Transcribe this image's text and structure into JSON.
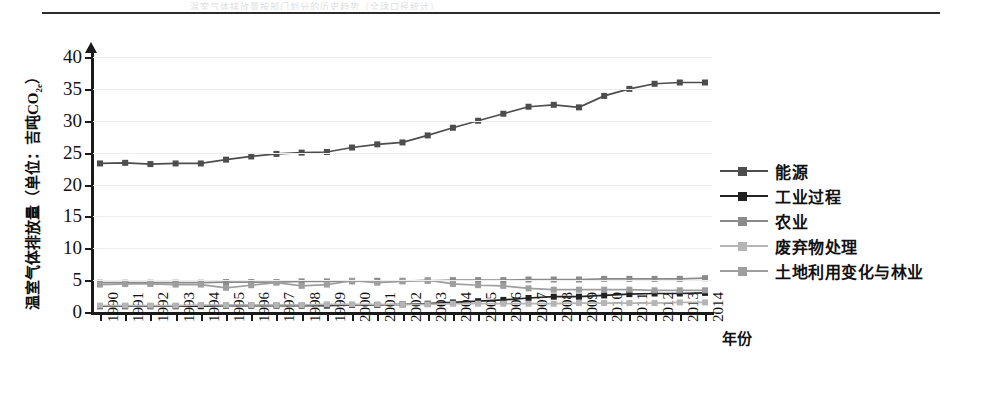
{
  "header": {
    "ghost_text": "温室气体排放量按部门划分的历史趋势（全球口径统计）",
    "has_rule": true
  },
  "axes": {
    "y_title": "温室气体排放量（单位：吉吨CO",
    "y_title_sub": "2e",
    "y_title_tail": "）",
    "y_ticks": [
      0,
      5,
      10,
      15,
      20,
      25,
      30,
      35,
      40
    ],
    "y_min": 0,
    "y_max": 40,
    "x_title": "年份",
    "grid": "horizontal"
  },
  "legend": {
    "position": "right",
    "items": [
      {
        "label": "能源",
        "color": "#4d4d4d"
      },
      {
        "label": "工业过程",
        "color": "#222222"
      },
      {
        "label": "农业",
        "color": "#8a8a8a"
      },
      {
        "label": "废弃物处理",
        "color": "#b5b5b5"
      },
      {
        "label": "土地利用变化与林业",
        "color": "#9e9e9e"
      }
    ]
  },
  "chart_data": {
    "type": "line",
    "title": "",
    "xlabel": "年份",
    "ylabel": "温室气体排放量（单位：吉吨CO2e）",
    "ylim": [
      0,
      40
    ],
    "grid": true,
    "legend_position": "right",
    "categories": [
      "1990",
      "1991",
      "1992",
      "1993",
      "1994",
      "1995",
      "1996",
      "1997",
      "1998",
      "1999",
      "2000",
      "2001",
      "2002",
      "2003",
      "2004",
      "2005",
      "2006",
      "2007",
      "2008",
      "2009",
      "2010",
      "2011",
      "2012",
      "2013",
      "2014"
    ],
    "series": [
      {
        "name": "能源",
        "color": "#4d4d4d",
        "values": [
          23.3,
          23.4,
          23.2,
          23.3,
          23.3,
          23.9,
          24.4,
          24.8,
          25.0,
          25.1,
          25.8,
          26.3,
          26.6,
          27.7,
          28.9,
          30.0,
          31.1,
          32.2,
          32.5,
          32.1,
          33.9,
          35.0,
          35.8,
          36.0,
          36.0
        ]
      },
      {
        "name": "工业过程",
        "color": "#222222",
        "values": [
          0.9,
          0.9,
          0.9,
          0.9,
          0.9,
          1.0,
          1.0,
          1.0,
          1.0,
          1.0,
          1.1,
          1.1,
          1.2,
          1.3,
          1.5,
          1.7,
          1.9,
          2.2,
          2.4,
          2.4,
          2.6,
          2.8,
          2.9,
          2.9,
          3.0
        ]
      },
      {
        "name": "农业",
        "color": "#8a8a8a",
        "values": [
          4.6,
          4.6,
          4.6,
          4.6,
          4.6,
          4.7,
          4.7,
          4.7,
          4.8,
          4.8,
          4.8,
          4.9,
          4.9,
          4.9,
          5.0,
          5.0,
          5.0,
          5.1,
          5.1,
          5.1,
          5.2,
          5.2,
          5.2,
          5.2,
          5.3
        ]
      },
      {
        "name": "废弃物处理",
        "color": "#b5b5b5",
        "values": [
          1.0,
          1.0,
          1.0,
          1.0,
          1.1,
          1.1,
          1.1,
          1.1,
          1.1,
          1.2,
          1.2,
          1.2,
          1.2,
          1.2,
          1.3,
          1.3,
          1.3,
          1.3,
          1.3,
          1.4,
          1.4,
          1.4,
          1.4,
          1.5,
          1.5
        ]
      },
      {
        "name": "土地利用变化与林业",
        "color": "#9e9e9e",
        "values": [
          4.3,
          4.4,
          4.4,
          4.3,
          4.3,
          3.8,
          4.2,
          4.6,
          4.1,
          4.3,
          4.9,
          4.6,
          4.8,
          5.0,
          4.4,
          4.2,
          4.1,
          3.7,
          3.5,
          3.5,
          3.5,
          3.5,
          3.4,
          3.4,
          3.4
        ]
      }
    ]
  }
}
